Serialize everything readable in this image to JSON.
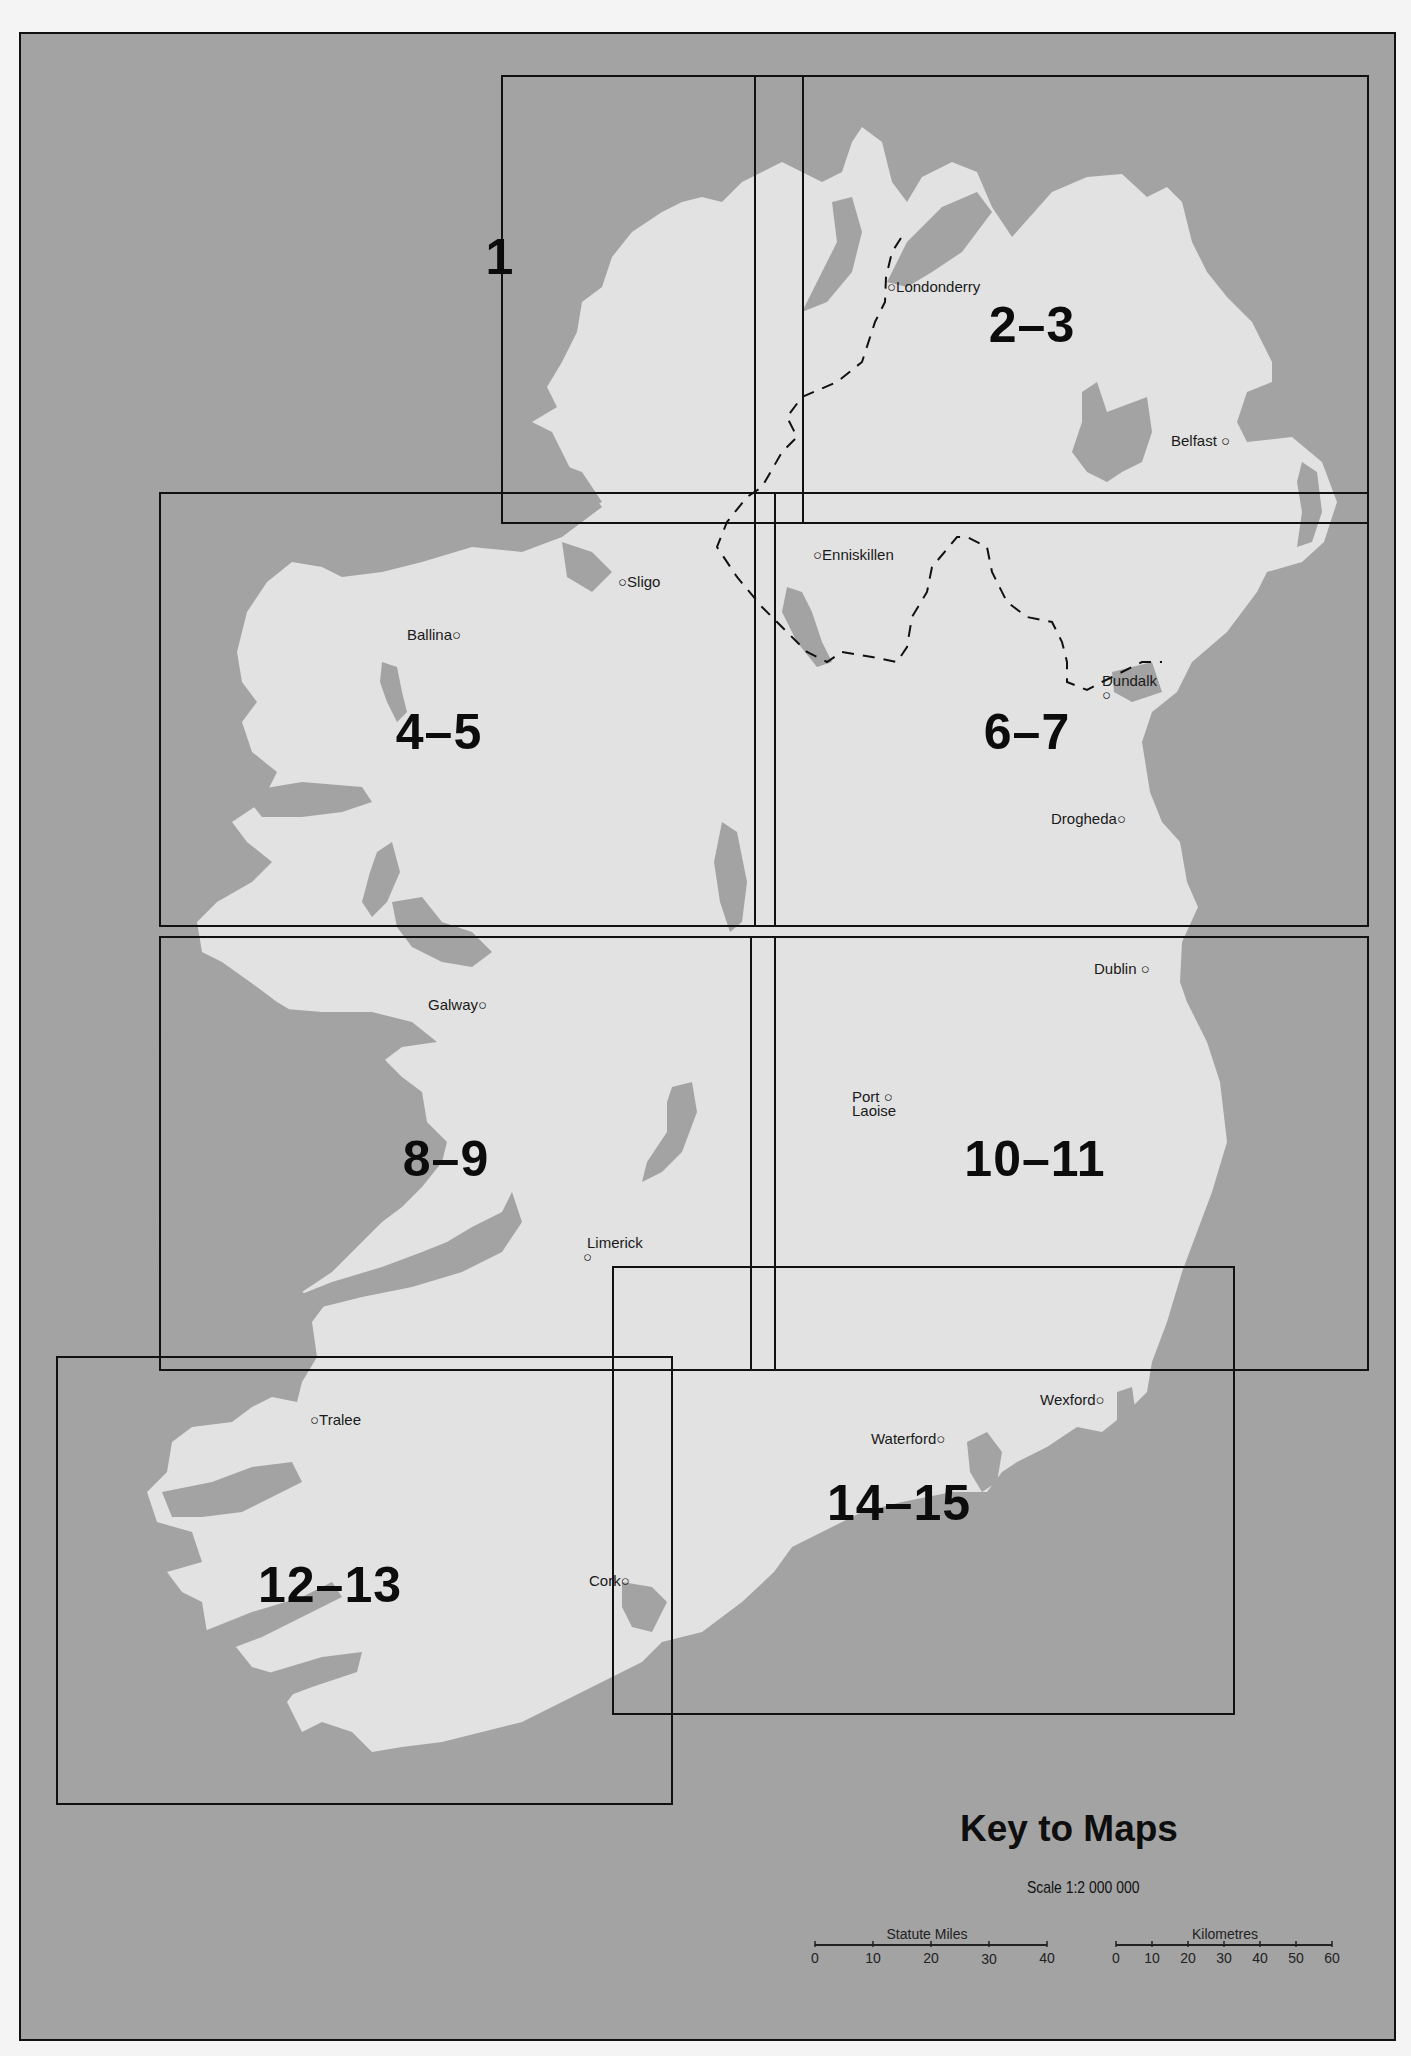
{
  "map": {
    "title": "Key to Maps",
    "scale": "Scale 1:2 000 000",
    "colors": {
      "sea": "#a3a3a3",
      "land": "#e2e2e2",
      "lakes": "#a3a3a3",
      "sheet_border": "#111111",
      "paper": "#f4f4f4"
    },
    "sheets": [
      {
        "label": "1",
        "x": 498,
        "y": 255
      },
      {
        "label": "2–3",
        "x": 1030,
        "y": 323
      },
      {
        "label": "4–5",
        "x": 437,
        "y": 730
      },
      {
        "label": "6–7",
        "x": 1025,
        "y": 730
      },
      {
        "label": "8–9",
        "x": 444,
        "y": 1157
      },
      {
        "label": "10–11",
        "x": 1033,
        "y": 1157
      },
      {
        "label": "12–13",
        "x": 328,
        "y": 1583
      },
      {
        "label": "14–15",
        "x": 897,
        "y": 1501
      }
    ],
    "towns": [
      {
        "name": "Londonderry",
        "x": 893,
        "y": 281,
        "dot": "before"
      },
      {
        "name": "Belfast",
        "x": 1171,
        "y": 437,
        "dot": "after"
      },
      {
        "name": "Enniskillen",
        "x": 831,
        "y": 552,
        "dot": "before"
      },
      {
        "name": "Sligo",
        "x": 630,
        "y": 579,
        "dot": "before"
      },
      {
        "name": "Ballina",
        "x": 412,
        "y": 632,
        "dot": "after"
      },
      {
        "name": "Dundalk",
        "x": 1111,
        "y": 677,
        "dot": "below"
      },
      {
        "name": "Drogheda",
        "x": 1056,
        "y": 816,
        "dot": "after"
      },
      {
        "name": "Dublin",
        "x": 1101,
        "y": 966,
        "dot": "after"
      },
      {
        "name": "Galway",
        "x": 428,
        "y": 1002,
        "dot": "after"
      },
      {
        "name": "Port",
        "x": 857,
        "y": 1094,
        "dot": "after"
      },
      {
        "name": "Laoise",
        "x": 857,
        "y": 1108,
        "dot": "none"
      },
      {
        "name": "Limerick",
        "x": 590,
        "y": 1239,
        "dot": "below"
      },
      {
        "name": "Tralee",
        "x": 321,
        "y": 1417,
        "dot": "before"
      },
      {
        "name": "Cork",
        "x": 590,
        "y": 1578,
        "dot": "after"
      },
      {
        "name": "Waterford",
        "x": 875,
        "y": 1436,
        "dot": "after"
      },
      {
        "name": "Wexford",
        "x": 1046,
        "y": 1397,
        "dot": "after"
      }
    ]
  },
  "scale_bars": {
    "miles": {
      "title": "Statute Miles",
      "ticks": [
        "0",
        "10",
        "20",
        "30",
        "40"
      ]
    },
    "kilometres": {
      "title": "Kilometres",
      "ticks": [
        "0",
        "10",
        "20",
        "30",
        "40",
        "50",
        "60"
      ]
    }
  }
}
